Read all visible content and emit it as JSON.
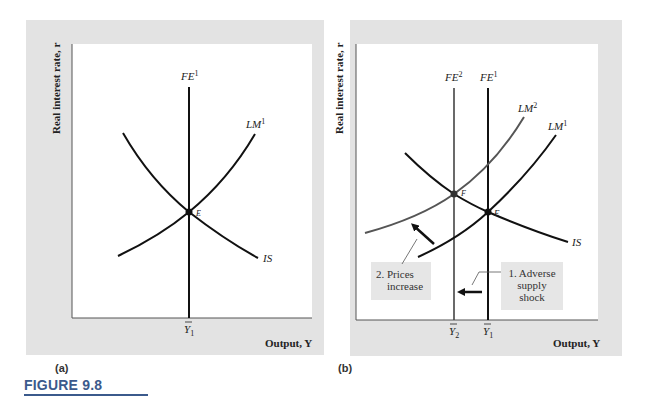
{
  "figure": {
    "title": "FIGURE 9.8"
  },
  "panels": [
    {
      "tag": "(a)",
      "y_axis_label": "Real interest rate, r",
      "x_axis_label": "Output, Y",
      "curves": [
        {
          "id": "FE1",
          "label": "FE",
          "superscript": "1",
          "type": "vertical",
          "color": "#111111"
        },
        {
          "id": "LM1",
          "label": "LM",
          "superscript": "1",
          "type": "upward",
          "color": "#111111"
        },
        {
          "id": "IS",
          "label": "IS",
          "superscript": "",
          "type": "downward",
          "color": "#111111"
        }
      ],
      "points": [
        {
          "label": "E"
        }
      ],
      "x_ticks": [
        {
          "label": "Y",
          "subscript": "1",
          "bar": true
        }
      ]
    },
    {
      "tag": "(b)",
      "y_axis_label": "Real interest rate, r",
      "x_axis_label": "Output, Y",
      "curves": [
        {
          "id": "FE2",
          "label": "FE",
          "superscript": "2",
          "type": "vertical",
          "color": "#444444"
        },
        {
          "id": "FE1",
          "label": "FE",
          "superscript": "1",
          "type": "vertical",
          "color": "#111111"
        },
        {
          "id": "LM2",
          "label": "LM",
          "superscript": "2",
          "type": "upward",
          "color": "#555555"
        },
        {
          "id": "LM1",
          "label": "LM",
          "superscript": "1",
          "type": "upward",
          "color": "#111111"
        },
        {
          "id": "IS",
          "label": "IS",
          "superscript": "",
          "type": "downward",
          "color": "#111111"
        }
      ],
      "points": [
        {
          "label": "F"
        },
        {
          "label": "E"
        }
      ],
      "x_ticks": [
        {
          "label": "Y",
          "subscript": "2",
          "bar": true
        },
        {
          "label": "Y",
          "subscript": "1",
          "bar": true
        }
      ],
      "callouts": [
        {
          "lines": [
            "1. Adverse",
            "supply",
            "shock"
          ]
        },
        {
          "lines": [
            "2. Prices",
            "increase"
          ]
        }
      ]
    }
  ]
}
